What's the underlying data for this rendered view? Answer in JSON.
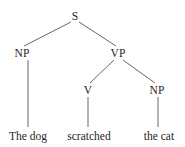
{
  "figure": {
    "kind": "syntax-tree",
    "sentence": "The dog scratched the cat",
    "background_color": "#ffffff",
    "line_color": "#555555",
    "text_color": "#1f1f1f"
  },
  "nodes": {
    "s": {
      "label": "S",
      "x": 75,
      "y": 16
    },
    "np_subject": {
      "label": "NP",
      "x": 22,
      "y": 53
    },
    "vp": {
      "label": "VP",
      "x": 118,
      "y": 53
    },
    "v": {
      "label": "V",
      "x": 88,
      "y": 90
    },
    "np_object": {
      "label": "NP",
      "x": 157,
      "y": 90
    }
  },
  "terminals": {
    "subject": {
      "label": "The dog",
      "x": 28,
      "y": 130
    },
    "verb": {
      "label": "scratched",
      "x": 89,
      "y": 130
    },
    "object": {
      "label": "the cat",
      "x": 159,
      "y": 130
    }
  },
  "edges": [
    {
      "name": "s-to-np-subject",
      "x1": 71,
      "y1": 22,
      "x2": 24,
      "y2": 46
    },
    {
      "name": "s-to-vp",
      "x1": 79,
      "y1": 22,
      "x2": 116,
      "y2": 46
    },
    {
      "name": "vp-to-v",
      "x1": 114,
      "y1": 60,
      "x2": 90,
      "y2": 83
    },
    {
      "name": "vp-to-np-object",
      "x1": 123,
      "y1": 60,
      "x2": 155,
      "y2": 83
    },
    {
      "name": "np-subject-to-the-dog",
      "x1": 28,
      "y1": 60,
      "x2": 28,
      "y2": 127
    },
    {
      "name": "v-to-scratched",
      "x1": 88,
      "y1": 97,
      "x2": 88,
      "y2": 127
    },
    {
      "name": "np-object-to-the-cat",
      "x1": 158,
      "y1": 97,
      "x2": 158,
      "y2": 127
    }
  ]
}
